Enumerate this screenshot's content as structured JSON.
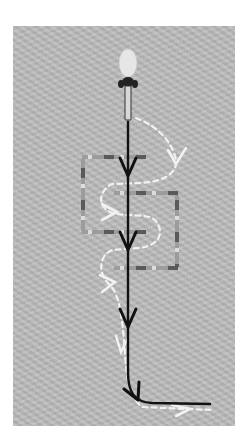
{
  "diagram": {
    "colors": {
      "background_panel": "#b9b9b9",
      "page": "#ffffff",
      "direct_line": "#111111",
      "dashed_line": "#f2f2f2",
      "gate_pole_light": "#9a9a9a",
      "gate_pole_dark": "#555555"
    },
    "skier": {
      "x": 128,
      "y": 62,
      "label": "skier-top-view"
    },
    "gates": [
      {
        "name": "gate-left",
        "top_y": 157,
        "bottom_y": 232,
        "left_x": 83,
        "right_x": 145,
        "open_side": "right"
      },
      {
        "name": "gate-right",
        "top_y": 193,
        "bottom_y": 268,
        "left_x": 115,
        "right_x": 177,
        "open_side": "left"
      }
    ],
    "direct_line_arrows": [
      {
        "x": 128,
        "y": 170
      },
      {
        "x": 128,
        "y": 244
      },
      {
        "x": 128,
        "y": 320
      },
      {
        "x": 132,
        "y": 395
      }
    ],
    "dashed_line_arrows": [
      {
        "x": 174,
        "y": 158
      },
      {
        "x": 110,
        "y": 212
      },
      {
        "x": 108,
        "y": 282
      },
      {
        "x": 120,
        "y": 345
      },
      {
        "x": 186,
        "y": 410
      }
    ]
  }
}
